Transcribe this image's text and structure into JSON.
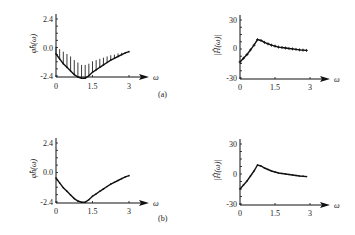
{
  "chart_data": [
    {
      "id": "a-phase",
      "panel": "(a)",
      "type": "line",
      "title": "",
      "xlabel": "ω",
      "ylabel": "φ̂_h(ω)",
      "xlim": [
        0,
        3
      ],
      "ylim": [
        -2.4,
        2.4
      ],
      "xticks": [
        "0",
        "1.5",
        "3"
      ],
      "yticks": [
        "2.4",
        "0.0",
        "-2.4"
      ],
      "error_bars": "upper vertical bars",
      "x": [
        0,
        0.15,
        0.3,
        0.45,
        0.6,
        0.75,
        0.9,
        1.05,
        1.2,
        1.35,
        1.5,
        1.65,
        1.8,
        1.95,
        2.1,
        2.25,
        2.4,
        2.55,
        2.7,
        2.85,
        3.0
      ],
      "values": [
        -0.5,
        -0.9,
        -1.3,
        -1.6,
        -1.9,
        -2.2,
        -2.4,
        -2.5,
        -2.5,
        -2.3,
        -2.0,
        -1.8,
        -1.6,
        -1.4,
        -1.2,
        -1.0,
        -0.85,
        -0.7,
        -0.55,
        -0.4,
        -0.3
      ],
      "upper": [
        0.1,
        -0.1,
        -0.3,
        -0.5,
        -0.7,
        -1.0,
        -1.2,
        -1.4,
        -1.4,
        -1.3,
        -1.1,
        -1.0,
        -0.9,
        -0.8,
        -0.7,
        -0.6,
        -0.55,
        -0.45,
        -0.4,
        -0.35,
        -0.3
      ]
    },
    {
      "id": "a-magnitude",
      "panel": "(a)",
      "type": "line",
      "title": "",
      "xlabel": "ω",
      "ylabel": "|Ĥ(ω)|",
      "xlim": [
        0,
        3
      ],
      "ylim": [
        -30,
        30
      ],
      "xticks": [
        "0",
        "1.5",
        "3"
      ],
      "yticks": [
        "30",
        "0",
        "-30"
      ],
      "markers": "plus",
      "x": [
        0,
        0.15,
        0.3,
        0.45,
        0.6,
        0.75,
        0.9,
        1.05,
        1.2,
        1.35,
        1.5,
        1.65,
        1.8,
        1.95,
        2.1,
        2.25,
        2.4,
        2.55,
        2.7,
        2.85
      ],
      "values": [
        -15,
        -11,
        -7,
        -2,
        3,
        9,
        8,
        6,
        4.5,
        3,
        2,
        1,
        0.5,
        0,
        -0.5,
        -1,
        -1.5,
        -2,
        -2.3,
        -2.6
      ]
    },
    {
      "id": "b-phase",
      "panel": "(b)",
      "type": "line",
      "title": "",
      "xlabel": "ω",
      "ylabel": "φ̂_h(ω)",
      "xlim": [
        0,
        3
      ],
      "ylim": [
        -2.4,
        2.4
      ],
      "xticks": [
        "0",
        "1.5",
        "3"
      ],
      "yticks": [
        "2.4",
        "0.0",
        "-2.4"
      ],
      "x": [
        0,
        0.15,
        0.3,
        0.45,
        0.6,
        0.75,
        0.9,
        1.05,
        1.2,
        1.35,
        1.5,
        1.65,
        1.8,
        1.95,
        2.1,
        2.25,
        2.4,
        2.55,
        2.7,
        2.85,
        3.0
      ],
      "values": [
        -0.5,
        -0.9,
        -1.3,
        -1.6,
        -1.9,
        -2.2,
        -2.4,
        -2.5,
        -2.5,
        -2.3,
        -2.0,
        -1.8,
        -1.6,
        -1.4,
        -1.2,
        -1.0,
        -0.85,
        -0.7,
        -0.55,
        -0.4,
        -0.3
      ]
    },
    {
      "id": "b-magnitude",
      "panel": "(b)",
      "type": "line",
      "title": "",
      "xlabel": "ω",
      "ylabel": "|Ĥ(ω)|",
      "xlim": [
        0,
        3
      ],
      "ylim": [
        -30,
        30
      ],
      "xticks": [
        "0",
        "1.5",
        "3"
      ],
      "yticks": [
        "30",
        "0",
        "-30"
      ],
      "x": [
        0,
        0.15,
        0.3,
        0.45,
        0.6,
        0.75,
        0.9,
        1.05,
        1.2,
        1.35,
        1.5,
        1.65,
        1.8,
        1.95,
        2.1,
        2.25,
        2.4,
        2.55,
        2.7,
        2.85
      ],
      "values": [
        -15,
        -11,
        -7,
        -2,
        3,
        9,
        8,
        6,
        4.5,
        3,
        2,
        1,
        0.5,
        0,
        -0.5,
        -1,
        -1.5,
        -2,
        -2.3,
        -2.6
      ]
    }
  ],
  "panels": {
    "a_label": "(a)",
    "b_label": "(b)"
  },
  "axis": {
    "omega": "ω",
    "phase_ylabel": "φ̂h(ω)",
    "mag_ylabel": "|Ĥ(ω)|"
  },
  "layout": [
    {
      "chart": 0,
      "x0": 56,
      "xEnd": 129,
      "yZero": 48,
      "yTop": 19,
      "yBot": 76,
      "axisY": 77,
      "labelY": 89
    },
    {
      "chart": 1,
      "x0": 240,
      "xEnd": 310,
      "yZero": 48,
      "yTop": 20,
      "yBot": 78,
      "axisY": 79,
      "labelY": 90
    },
    {
      "chart": 2,
      "x0": 56,
      "xEnd": 129,
      "yZero": 172,
      "yTop": 143,
      "yBot": 202,
      "axisY": 203,
      "labelY": 214
    },
    {
      "chart": 3,
      "x0": 240,
      "xEnd": 310,
      "yZero": 174,
      "yTop": 144,
      "yBot": 204,
      "axisY": 205,
      "labelY": 216
    }
  ]
}
